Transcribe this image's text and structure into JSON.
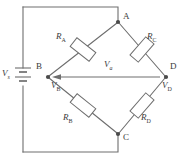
{
  "diagram": {
    "type": "circuit-schematic",
    "stroke_color": "#6e6e6e",
    "text_color": "#3a3a3a",
    "background": "#ffffff",
    "nodes": [
      {
        "id": "A",
        "label": "A",
        "x": 118,
        "y": 22,
        "label_x": 123,
        "label_y": 13
      },
      {
        "id": "B",
        "label": "B",
        "x": 48,
        "y": 77,
        "label_x": 37,
        "label_y": 63
      },
      {
        "id": "C",
        "label": "C",
        "x": 118,
        "y": 134,
        "label_x": 123,
        "label_y": 134
      },
      {
        "id": "D",
        "label": "D",
        "x": 166,
        "y": 77,
        "label_x": 169,
        "label_y": 63
      }
    ],
    "resistors": [
      {
        "id": "RA",
        "letter": "R",
        "sub": "A",
        "label_x": 57,
        "label_y": 36
      },
      {
        "id": "RC",
        "letter": "R",
        "sub": "C",
        "label_x": 147,
        "label_y": 36
      },
      {
        "id": "RB",
        "letter": "R",
        "sub": "B",
        "label_x": 64,
        "label_y": 116
      },
      {
        "id": "RD",
        "letter": "R",
        "sub": "D",
        "label_x": 140,
        "label_y": 116
      }
    ],
    "sources": [
      {
        "id": "Vs",
        "letter": "V",
        "sub": "s",
        "label_x": 2,
        "label_y": 74,
        "symbol": "battery"
      }
    ],
    "potentials": [
      {
        "id": "VB",
        "letter": "V",
        "sub": "B",
        "label_x": 52,
        "label_y": 84
      },
      {
        "id": "VD",
        "letter": "V",
        "sub": "D",
        "label_x": 161,
        "label_y": 84
      }
    ],
    "measurements": [
      {
        "id": "Va",
        "letter": "V",
        "sub": "a",
        "label_x": 104,
        "label_y": 61,
        "arrow_from_x": 160,
        "arrow_to_x": 54,
        "arrow_y": 77
      }
    ]
  }
}
